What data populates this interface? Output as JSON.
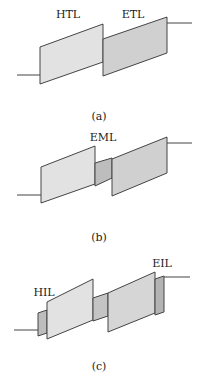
{
  "panels": [
    {
      "id": "a",
      "caption": "(a)",
      "labels": [
        {
          "text": "HTL"
        },
        {
          "text": "ETL"
        }
      ]
    },
    {
      "id": "b",
      "caption": "(b)",
      "labels": [
        {
          "text": "EML"
        }
      ]
    },
    {
      "id": "c",
      "caption": "(c)",
      "labels": [
        {
          "text": "HIL"
        },
        {
          "text": "EIL"
        }
      ]
    }
  ],
  "colors": {
    "light": "#e0e0e0",
    "medium": "#cfcfcf",
    "dark": "#b8b8b8",
    "line": "#444444"
  }
}
